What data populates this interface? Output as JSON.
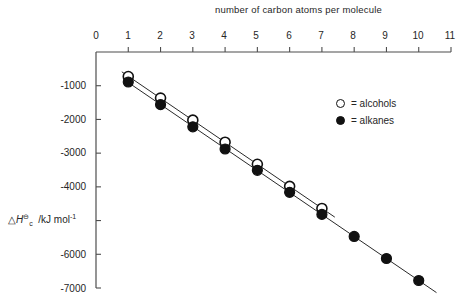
{
  "chart_data": {
    "type": "scatter",
    "title": "number of carbon atoms per molecule",
    "xlabel": "number of carbon atoms per molecule",
    "ylabel": "ΔH⊖c /kJ mol⁻¹",
    "ylabel_parts": {
      "delta": "△",
      "h": "H",
      "standard": "⊖",
      "subscript": "c",
      "units": "/kJ mol",
      "units_exponent": "-1"
    },
    "xlim": [
      0,
      11
    ],
    "ylim": [
      -7000,
      0
    ],
    "xticks": [
      0,
      1,
      2,
      3,
      4,
      5,
      6,
      7,
      8,
      9,
      10,
      11
    ],
    "xticklabels": [
      "0",
      "1",
      "2",
      "3",
      "4",
      "5",
      "6",
      "7",
      "8",
      "9",
      "10",
      "11"
    ],
    "yticks": [
      -1000,
      -2000,
      -3000,
      -4000,
      -5000,
      -6000,
      -7000
    ],
    "yticklabels": [
      "-1000",
      "-2000",
      "-3000",
      "-4000",
      "",
      "-6000",
      "-7000"
    ],
    "grid": false,
    "legend_position": "upper right",
    "series": [
      {
        "name": "alcohols",
        "marker": "open-circle",
        "color": "#111111",
        "x": [
          1,
          2,
          3,
          4,
          5,
          6,
          7
        ],
        "values": [
          -726,
          -1367,
          -2021,
          -2676,
          -3331,
          -3985,
          -4640
        ],
        "trendline": {
          "from_x": 0.8,
          "to_x": 7.4
        }
      },
      {
        "name": "alkanes",
        "marker": "filled-circle",
        "color": "#111111",
        "x": [
          1,
          2,
          3,
          4,
          5,
          6,
          7,
          8,
          9,
          10
        ],
        "values": [
          -890,
          -1560,
          -2220,
          -2877,
          -3509,
          -4163,
          -4817,
          -5470,
          -6125,
          -6778
        ],
        "trendline": {
          "from_x": 0.85,
          "to_x": 10.55
        }
      }
    ]
  },
  "legend": {
    "rows": [
      {
        "marker": "open-circle",
        "label": "= alcohols"
      },
      {
        "marker": "filled-circle",
        "label": "= alkanes"
      }
    ]
  },
  "axes": {
    "x_axis_name": "x-axis",
    "y_axis_name": "y-axis"
  }
}
